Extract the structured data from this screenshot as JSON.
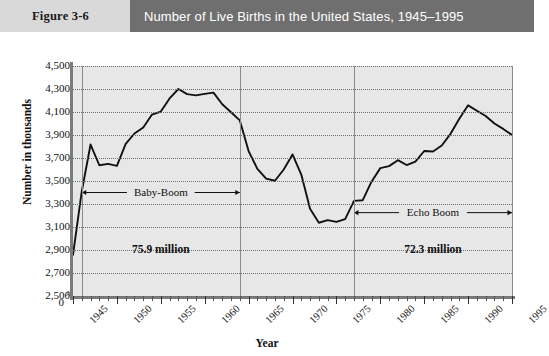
{
  "header": {
    "figure_number": "Figure 3-6",
    "title": "Number of Live Births in the United States, 1945–1995",
    "band_color": "#d9d9d9",
    "title_band_color": "#6f6f6f"
  },
  "chart_data": {
    "type": "line",
    "title": "Number of Live Births in the United States, 1945–1995",
    "xlabel": "Year",
    "ylabel": "Number in thousands",
    "xlim": [
      1945,
      1995
    ],
    "ylim": [
      2500,
      4500
    ],
    "ytick_step": 200,
    "ytick_labels": [
      "4,500",
      "4,300",
      "4,100",
      "3,900",
      "3,700",
      "3,500",
      "3,300",
      "3,100",
      "2,900",
      "2,700",
      "2,500"
    ],
    "ytick_values": [
      4500,
      4300,
      4100,
      3900,
      3700,
      3500,
      3300,
      3100,
      2900,
      2700,
      2500
    ],
    "axis_break_label": "0",
    "axis_break_symbol": "≈",
    "xtick_labels": [
      "1945",
      "1950",
      "1955",
      "1960",
      "1965",
      "1970",
      "1975",
      "1980",
      "1985",
      "1990",
      "1995"
    ],
    "xtick_values": [
      1945,
      1950,
      1955,
      1960,
      1965,
      1970,
      1975,
      1980,
      1985,
      1990,
      1995
    ],
    "grid": true,
    "grid_style": "dotted-horizontal",
    "legend": null,
    "plot_background": "#e7e7e7",
    "line_color": "#111111",
    "x": [
      1945,
      1946,
      1947,
      1948,
      1949,
      1950,
      1951,
      1952,
      1953,
      1954,
      1955,
      1956,
      1957,
      1958,
      1959,
      1960,
      1961,
      1962,
      1963,
      1964,
      1965,
      1966,
      1967,
      1968,
      1969,
      1970,
      1971,
      1972,
      1973,
      1974,
      1975,
      1976,
      1977,
      1978,
      1979,
      1980,
      1981,
      1982,
      1983,
      1984,
      1985,
      1986,
      1987,
      1988,
      1989,
      1990,
      1991,
      1992,
      1993,
      1994,
      1995
    ],
    "values": [
      2858,
      3411,
      3817,
      3637,
      3649,
      3632,
      3823,
      3913,
      3965,
      4078,
      4104,
      4218,
      4300,
      4255,
      4245,
      4258,
      4268,
      4167,
      4098,
      4027,
      3760,
      3606,
      3521,
      3502,
      3600,
      3731,
      3556,
      3258,
      3137,
      3160,
      3144,
      3168,
      3327,
      3333,
      3494,
      3612,
      3629,
      3681,
      3639,
      3669,
      3761,
      3757,
      3809,
      3910,
      4041,
      4158,
      4111,
      4065,
      4000,
      3953,
      3900
    ],
    "vertical_markers": [
      {
        "year": 1946,
        "label": "baby-boom-start"
      },
      {
        "year": 1964,
        "label": "baby-boom-end"
      },
      {
        "year": 1977,
        "label": "echo-boom-start"
      },
      {
        "year": 1995,
        "label": "echo-boom-end"
      }
    ],
    "annotations": [
      {
        "name": "baby-boom",
        "text": "Baby-Boom",
        "from_year": 1946,
        "to_year": 1964,
        "value": 3400,
        "style": "double-arrow"
      },
      {
        "name": "baby-boom-total",
        "text": "75.9 million",
        "year": 1955,
        "value": 2900,
        "style": "text"
      },
      {
        "name": "echo-boom",
        "text": "Echo Boom",
        "from_year": 1977,
        "to_year": 1995,
        "value": 3225,
        "style": "double-arrow"
      },
      {
        "name": "echo-boom-total",
        "text": "72.3 million",
        "year": 1986,
        "value": 2900,
        "style": "text"
      }
    ]
  }
}
